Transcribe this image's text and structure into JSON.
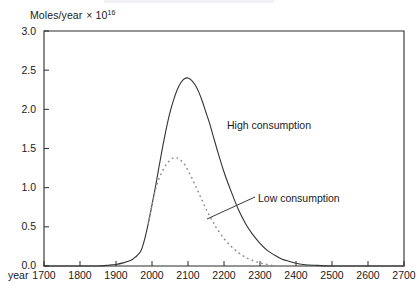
{
  "chart_data": {
    "type": "line",
    "title": "",
    "xlabel": "year",
    "ylabel": "Moles/year",
    "y_unit_multiplier": "× 10",
    "y_unit_exponent": "16",
    "xlim": [
      1700,
      2700
    ],
    "ylim": [
      0.0,
      3.0
    ],
    "grid": false,
    "legend_position": "inline-annotations",
    "x_ticks": [
      "1700",
      "1800",
      "1900",
      "2000",
      "2100",
      "2200",
      "2300",
      "2400",
      "2500",
      "2600",
      "2700"
    ],
    "y_ticks": [
      "0.0",
      "0.5",
      "1.0",
      "1.5",
      "2.0",
      "2.5",
      "3.0"
    ],
    "series": [
      {
        "name": "High consumption",
        "style": "solid",
        "color": "#333333",
        "x": [
          1700,
          1750,
          1800,
          1850,
          1880,
          1900,
          1920,
          1940,
          1950,
          1960,
          1970,
          1980,
          1990,
          2000,
          2010,
          2020,
          2030,
          2040,
          2050,
          2060,
          2070,
          2080,
          2090,
          2100,
          2110,
          2120,
          2130,
          2140,
          2150,
          2160,
          2180,
          2200,
          2220,
          2240,
          2260,
          2280,
          2300,
          2320,
          2340,
          2360,
          2380,
          2400,
          2420,
          2450,
          2500,
          2600,
          2700
        ],
        "y": [
          0.0,
          0.0,
          0.0,
          0.0,
          0.01,
          0.02,
          0.04,
          0.07,
          0.1,
          0.14,
          0.2,
          0.35,
          0.55,
          0.78,
          1.02,
          1.28,
          1.53,
          1.76,
          1.96,
          2.12,
          2.25,
          2.34,
          2.39,
          2.4,
          2.37,
          2.31,
          2.22,
          2.1,
          1.96,
          1.82,
          1.5,
          1.2,
          0.95,
          0.72,
          0.54,
          0.4,
          0.29,
          0.2,
          0.14,
          0.09,
          0.06,
          0.035,
          0.02,
          0.01,
          0.0,
          0.0,
          0.0
        ]
      },
      {
        "name": "Low consumption",
        "style": "dotted",
        "color": "#8c8c8c",
        "x": [
          1990,
          2000,
          2010,
          2020,
          2030,
          2040,
          2050,
          2060,
          2070,
          2080,
          2090,
          2100,
          2110,
          2120,
          2130,
          2140,
          2150,
          2160,
          2170,
          2180,
          2200,
          2220,
          2240,
          2260,
          2280,
          2300,
          2320,
          2340
        ],
        "y": [
          0.55,
          0.78,
          0.98,
          1.12,
          1.22,
          1.3,
          1.35,
          1.38,
          1.38,
          1.35,
          1.3,
          1.22,
          1.13,
          1.03,
          0.93,
          0.83,
          0.73,
          0.64,
          0.56,
          0.48,
          0.35,
          0.25,
          0.17,
          0.11,
          0.07,
          0.04,
          0.02,
          0.0
        ]
      }
    ],
    "annotations": [
      {
        "name": "high-consumption-label",
        "text": "High consumption",
        "x_px": 227,
        "y_px": 120
      },
      {
        "name": "low-consumption-label",
        "text": "Low consumption",
        "x_px": 258,
        "y_px": 193
      }
    ]
  },
  "axes": {
    "y_unit_text": "Moles/year",
    "y_unit_multiplier": "× 10",
    "y_unit_exponent": "16",
    "x_axis_name": "year"
  }
}
